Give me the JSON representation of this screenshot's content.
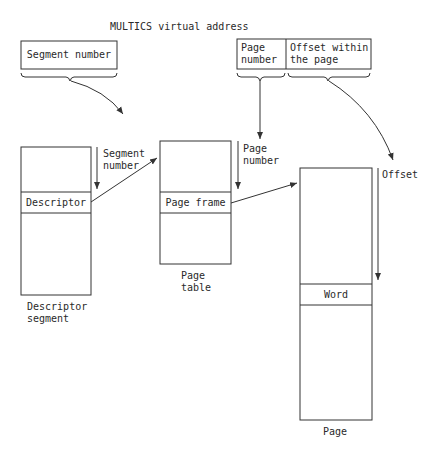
{
  "title": "MULTICS virtual address",
  "address_fields": {
    "segment_number": "Segment number",
    "page_number_line1": "Page",
    "page_number_line2": "number",
    "offset_line1": "Offset within",
    "offset_line2": "the page"
  },
  "descriptor_segment": {
    "entry": "Descriptor",
    "caption_line1": "Descriptor",
    "caption_line2": "segment",
    "index_label_line1": "Segment",
    "index_label_line2": "number"
  },
  "page_table": {
    "entry": "Page frame",
    "caption_line1": "Page",
    "caption_line2": "table",
    "index_label_line1": "Page",
    "index_label_line2": "number"
  },
  "page": {
    "entry": "Word",
    "caption": "Page",
    "index_label": "Offset"
  },
  "colors": {
    "line": "#333333",
    "background": "#ffffff"
  }
}
